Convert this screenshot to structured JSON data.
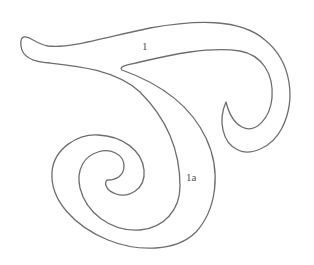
{
  "figure": {
    "stroke_color": "#6e6e6e",
    "background": "#ffffff",
    "labels": [
      {
        "id": "curve-1",
        "text": "1",
        "x": 142,
        "y": 50
      },
      {
        "id": "curve-1a",
        "text": "1a",
        "x": 186,
        "y": 181
      }
    ]
  }
}
